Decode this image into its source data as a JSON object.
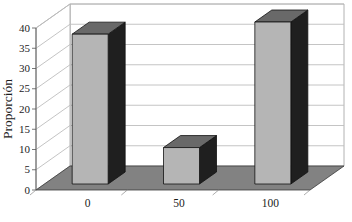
{
  "chart_data": {
    "type": "bar",
    "projection": "3d",
    "title": "",
    "xlabel": "",
    "ylabel": "Proporción",
    "categories": [
      "0",
      "50",
      "100"
    ],
    "values": [
      37,
      9,
      40
    ],
    "yticks": [
      0,
      5,
      10,
      15,
      20,
      25,
      30,
      35,
      40
    ],
    "ylim": [
      0,
      40
    ],
    "grid": true,
    "legend": false,
    "colors": {
      "bar_front": "#b5b5b5",
      "bar_top": "#696969",
      "bar_side": "#1f1f1f",
      "floor": "#828282",
      "wall": "#ffffff",
      "gridline": "#bdbdbd",
      "wall_edge": "#9e9e9e",
      "outline": "#111111",
      "text": "#1c1c1c"
    }
  }
}
